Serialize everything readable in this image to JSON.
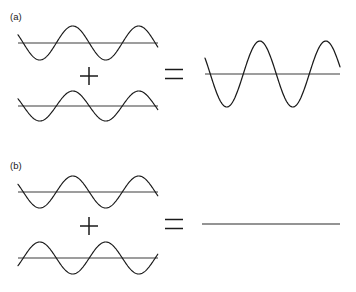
{
  "figure": {
    "background_color": "#ffffff",
    "stroke_color": "#1a1a1a",
    "axis_color": "#3c3c3c",
    "width": 356,
    "height": 292
  },
  "panels": [
    {
      "id": "a",
      "label": "(a)",
      "label_x": 10,
      "label_y": 20,
      "interference_type": "constructive",
      "operator_plus": "+",
      "operator_equals": "=",
      "inputs": [
        {
          "name": "wave-a-input-1",
          "baseline_y": 43,
          "x_start": 18,
          "x_end": 158,
          "amplitude": 17,
          "wavelength": 66,
          "phase_degrees": 0,
          "start_phase_offset": 0.42,
          "description": "sine wave, amplitude 17 px, in phase"
        },
        {
          "name": "wave-a-input-2",
          "baseline_y": 106,
          "x_start": 18,
          "x_end": 158,
          "amplitude": 15,
          "wavelength": 66,
          "phase_degrees": 0,
          "start_phase_offset": 0.42,
          "description": "sine wave, amplitude 15 px, in phase"
        }
      ],
      "result": {
        "name": "wave-a-result",
        "baseline_y": 74,
        "x_start": 205,
        "x_end": 340,
        "amplitude": 33,
        "wavelength": 66,
        "phase_degrees": 0,
        "start_phase_offset": 0.42,
        "flat": false,
        "description": "summed wave, amplitude 33 px (constructive)"
      },
      "plus_sign": {
        "cx": 89,
        "cy": 76,
        "size": 18
      },
      "equals_sign": {
        "cx": 174,
        "cy": 74,
        "width": 18,
        "gap": 9
      }
    },
    {
      "id": "b",
      "label": "(b)",
      "label_x": 10,
      "label_y": 169,
      "interference_type": "destructive",
      "operator_plus": "+",
      "operator_equals": "=",
      "inputs": [
        {
          "name": "wave-b-input-1",
          "baseline_y": 192,
          "x_start": 18,
          "x_end": 158,
          "amplitude": 16,
          "wavelength": 66,
          "phase_degrees": 0,
          "start_phase_offset": 0.42,
          "description": "sine wave, amplitude 16 px"
        },
        {
          "name": "wave-b-input-2",
          "baseline_y": 258,
          "x_start": 18,
          "x_end": 158,
          "amplitude": 16,
          "wavelength": 66,
          "phase_degrees": 180,
          "start_phase_offset": 0.42,
          "description": "sine wave, amplitude 16 px, inverted 180 degrees out of phase"
        }
      ],
      "result": {
        "name": "wave-b-result",
        "baseline_y": 224,
        "x_start": 202,
        "x_end": 340,
        "amplitude": 0,
        "wavelength": 66,
        "phase_degrees": 0,
        "start_phase_offset": 0.42,
        "flat": true,
        "description": "flat line, total cancellation (destructive)"
      },
      "plus_sign": {
        "cx": 89,
        "cy": 226,
        "size": 18
      },
      "equals_sign": {
        "cx": 174,
        "cy": 224,
        "width": 18,
        "gap": 9
      }
    }
  ]
}
